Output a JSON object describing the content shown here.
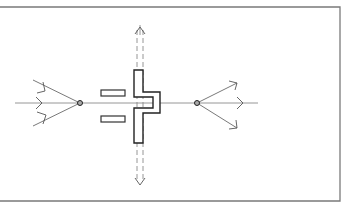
{
  "diagram": {
    "type": "line-drawing",
    "colors": {
      "background": "#ffffff",
      "frame": "#7a7a7a",
      "lines": "#6a6a6a",
      "shape": "#222222"
    },
    "elements": {
      "frame": "open-left rectangular border",
      "horizontal_axis": "horizontal line with arrows",
      "left_node": "convergence node with three incoming arrows",
      "right_node": "divergence node with three outgoing arrows",
      "vertical_axis": "dashed double line with arrows up and down",
      "central_shape": "vertical bar with right-side notch",
      "left_rectangles": 2
    },
    "text": []
  }
}
